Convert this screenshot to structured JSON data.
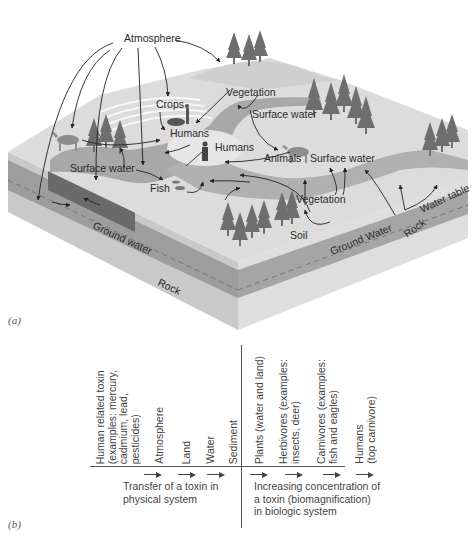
{
  "panel_a": {
    "label": "(a)",
    "nodes": {
      "atmosphere": "Atmosphere",
      "vegetation_top": "Vegetation",
      "crops": "Crops",
      "humans_1": "Humans",
      "humans_2": "Humans",
      "surface_water_1": "Surface water",
      "surface_water_2": "Surface water",
      "surface_water_3": "Surface water",
      "animals": "Animals",
      "fish": "Fish",
      "vegetation_bottom": "Vegetation",
      "soil": "Soil",
      "ground_water_left": "Ground water",
      "ground_water_right": "Ground Water",
      "rock_front": "Rock",
      "rock_right": "Rock",
      "water_table": "Water table"
    },
    "colors": {
      "top_surface": "#d9d9d9",
      "water": "#a6a6a6",
      "dark_layer": "#6e6e6e",
      "ground_water_layer": "#9a9a9a",
      "rock_layer": "#c8c8c8",
      "trees": "#6a6a6a",
      "arrows": "#222222"
    }
  },
  "panel_b": {
    "label": "(b)",
    "physical_columns": [
      "Human related toxin\n(examples: mercury,\ncadmium, lead,\npesticides)",
      "Atmosphere",
      "Land",
      "Water",
      "Sediment"
    ],
    "biologic_columns": [
      "Plants (water and land)",
      "Herbivores (examples:\ninsects, deer)",
      "Carnivores (examples:\nfish and eagles)",
      "Humans\n(top carnivore)"
    ],
    "physical_caption": "Transfer of a toxin in\nphysical system",
    "biologic_caption": "Increasing concentration of\na toxin (biomagnification)\nin biologic system"
  }
}
